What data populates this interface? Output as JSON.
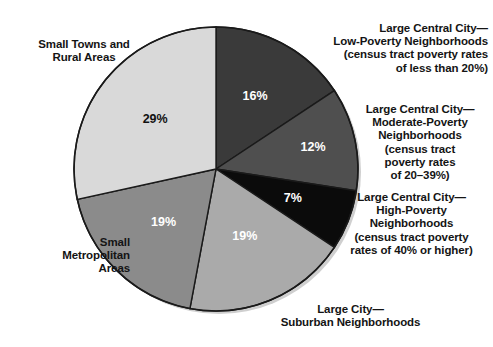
{
  "chart_data": {
    "type": "pie",
    "title": "",
    "subtitle": "",
    "xlabel": "",
    "ylabel": "",
    "legend_position": "callout-labels-around-pie",
    "grid": false,
    "units": "percent",
    "start_angle_deg": 0,
    "direction": "clockwise",
    "categories": [
      "Large Central City—\nLow-Poverty Neighborhoods\n(census tract poverty rates\nof less than 20%)",
      "Large Central City—\nModerate-Poverty\nNeighborhoods\n(census tract\npoverty rates\nof 20–39%)",
      "Large Central City—\nHigh-Poverty\nNeighborhoods\n(census tract poverty\nrates of 40% or higher)",
      "Large City—\nSuburban Neighborhoods",
      "Small\nMetropolitan\nAreas",
      "Small Towns and\nRural Areas"
    ],
    "values": [
      16,
      12,
      7,
      19,
      19,
      29
    ],
    "value_labels": [
      "16%",
      "12%",
      "7%",
      "19%",
      "19%",
      "29%"
    ],
    "slices": [
      {
        "key": "large-central-city-low-poverty",
        "label": "Large Central City—\nLow-Poverty Neighborhoods\n(census tract poverty rates\nof less than 20%)",
        "value": 16,
        "value_label": "16%",
        "color": "#3a3a3a",
        "label_color": "#ffffff"
      },
      {
        "key": "large-central-city-moderate-poverty",
        "label": "Large Central City—\nModerate-Poverty\nNeighborhoods\n(census tract\npoverty rates\nof 20–39%)",
        "value": 12,
        "value_label": "12%",
        "color": "#4f4f4f",
        "label_color": "#ffffff"
      },
      {
        "key": "large-central-city-high-poverty",
        "label": "Large Central City—\nHigh-Poverty\nNeighborhoods\n(census tract poverty\nrates of 40% or higher)",
        "value": 7,
        "value_label": "7%",
        "color": "#0b0b0b",
        "label_color": "#ffffff"
      },
      {
        "key": "large-city-suburban",
        "label": "Large City—\nSuburban Neighborhoods",
        "value": 19,
        "value_label": "19%",
        "color": "#aaaaaa",
        "label_color": "#ffffff"
      },
      {
        "key": "small-metropolitan-areas",
        "label": "Small\nMetropolitan\nAreas",
        "value": 19,
        "value_label": "19%",
        "color": "#8b8b8b",
        "label_color": "#ffffff"
      },
      {
        "key": "small-towns-rural-areas",
        "label": "Small Towns and\nRural Areas",
        "value": 29,
        "value_label": "29%",
        "color": "#d9d9d9",
        "label_color": "#111111"
      }
    ]
  },
  "labels": {
    "small_towns": "Small Towns and\nRural Areas",
    "small_metro": "Small\nMetropolitan\nAreas",
    "large_central_low": "Large Central City—\nLow-Poverty Neighborhoods\n(census tract poverty rates\nof less than 20%)",
    "large_central_moderate": "Large Central City—\nModerate-Poverty\nNeighborhoods\n(census tract\npoverty rates\nof 20–39%)",
    "large_central_high": "Large Central City—\nHigh-Poverty\nNeighborhoods\n(census tract poverty\nrates of 40% or higher)",
    "large_city_suburban": "Large City—\nSuburban Neighborhoods"
  },
  "percent_labels": {
    "p16": "16%",
    "p12": "12%",
    "p7": "7%",
    "p19_suburban": "19%",
    "p19_metro": "19%",
    "p29": "29%"
  },
  "colors": {
    "background": "#ffffff",
    "outline": "#1a1a1a",
    "shadow": "#cfcfcf",
    "slice_low_poverty": "#3a3a3a",
    "slice_moderate_poverty": "#4f4f4f",
    "slice_high_poverty": "#0b0b0b",
    "slice_suburban": "#aaaaaa",
    "slice_small_metro": "#8b8b8b",
    "slice_small_towns": "#d9d9d9"
  }
}
